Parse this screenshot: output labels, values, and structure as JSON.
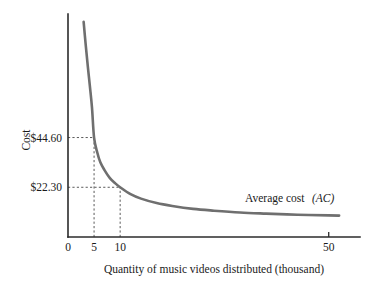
{
  "chart_data": {
    "type": "line",
    "title": "",
    "subtitle": "",
    "xlabel": "Quantity of music videos distributed (thousand)",
    "ylabel": "Cost",
    "xlim": [
      0,
      56
    ],
    "ylim": [
      0,
      100
    ],
    "grid": false,
    "legend_position": "inline-annotation",
    "series": [
      {
        "name": "Average cost (AC)",
        "label_text": "Average cost",
        "label_symbol": "(AC)",
        "x": [
          3.0,
          3.4,
          3.8,
          4.2,
          4.6,
          5.0,
          5.6,
          6.2,
          7.0,
          8.0,
          9.0,
          10.0,
          12.0,
          14.0,
          17.0,
          20.0,
          24.0,
          28.0,
          33.0,
          38.0,
          44.0,
          50.0,
          52.0
        ],
        "y": [
          96.5,
          86.0,
          76.5,
          67.5,
          58.0,
          44.6,
          38.0,
          33.5,
          30.0,
          26.5,
          24.2,
          22.3,
          19.2,
          17.2,
          15.2,
          13.9,
          12.6,
          11.8,
          11.0,
          10.5,
          10.0,
          9.7,
          9.6
        ]
      }
    ],
    "x_ticks": [
      {
        "value": 0,
        "label": "0",
        "show_tick_mark": false
      },
      {
        "value": 5,
        "label": "5",
        "show_tick_mark": false
      },
      {
        "value": 10,
        "label": "10",
        "show_tick_mark": false
      },
      {
        "value": 50,
        "label": "50",
        "show_tick_mark": true
      }
    ],
    "y_value_labels": [
      {
        "value": 44.6,
        "label": "$44.60",
        "at_x": 5
      },
      {
        "value": 22.3,
        "label": "$22.30",
        "at_x": 10
      }
    ],
    "guides": [
      {
        "from_axis": "y",
        "value": 44.6,
        "to_x": 5,
        "label": "$44.60"
      },
      {
        "from_axis": "y",
        "value": 22.3,
        "to_x": 10,
        "label": "$22.30"
      },
      {
        "from_axis": "x",
        "value": 5,
        "to_y": 44.6,
        "label": "5"
      },
      {
        "from_axis": "x",
        "value": 10,
        "to_y": 22.3,
        "label": "10"
      }
    ],
    "colors": {
      "curve": "#6f6f6f",
      "axis": "#2b2b2b",
      "guide": "#5a5a5a",
      "text": "#1a1a1a",
      "background": "#ffffff"
    }
  }
}
